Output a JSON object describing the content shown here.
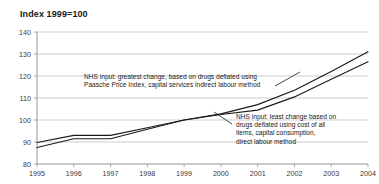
{
  "chart": {
    "title": "Index 1999=100"
  },
  "chart_data": {
    "type": "line",
    "title": "Index 1999=100",
    "xlabel": "",
    "ylabel": "",
    "grid": true,
    "legend_position": "none",
    "x": [
      1995,
      1996,
      1997,
      1998,
      1999,
      2000,
      2001,
      2002,
      2003,
      2004
    ],
    "xticklabels": [
      "1995",
      "1996",
      "1997",
      "1998",
      "1999",
      "2000",
      "2001",
      "2002",
      "2003",
      "2004"
    ],
    "yticks": [
      80,
      90,
      100,
      110,
      120,
      130,
      140
    ],
    "yticklabels": [
      "80",
      "90",
      "100",
      "110",
      "120",
      "130",
      "140"
    ],
    "ylim": [
      80,
      140
    ],
    "xlim": [
      1995,
      2004
    ],
    "series": [
      {
        "name": "NHS input: greatest change, based on drugs deflated using Paasche Price Index, capital services indirect labour method",
        "values": [
          89.8,
          93.0,
          93.0,
          96.5,
          100.0,
          102.8,
          107.0,
          113.5,
          122.0,
          131.0
        ]
      },
      {
        "name": "NHS input: least change based on drugs deflated using cost of all items, capital consumption, direct labour method",
        "values": [
          87.5,
          91.5,
          91.5,
          95.8,
          100.0,
          102.5,
          104.5,
          110.5,
          118.5,
          126.5
        ]
      }
    ],
    "annotations": [
      {
        "id": "upper",
        "lines": [
          "NHS input: greatest change, based on drugs deflated using",
          "Paasche Price Index, capital services indirect labour method"
        ]
      },
      {
        "id": "lower",
        "lines": [
          "NHS input: least change based on",
          "drugs deflated using cost of all",
          "items, capital consumption,",
          "direct labour method"
        ]
      }
    ],
    "colors": {
      "series_line": "#1a1a1a",
      "gridline": "#b8b8b8",
      "axis": "#8a8a8a",
      "text": "#1a1a1a"
    }
  }
}
